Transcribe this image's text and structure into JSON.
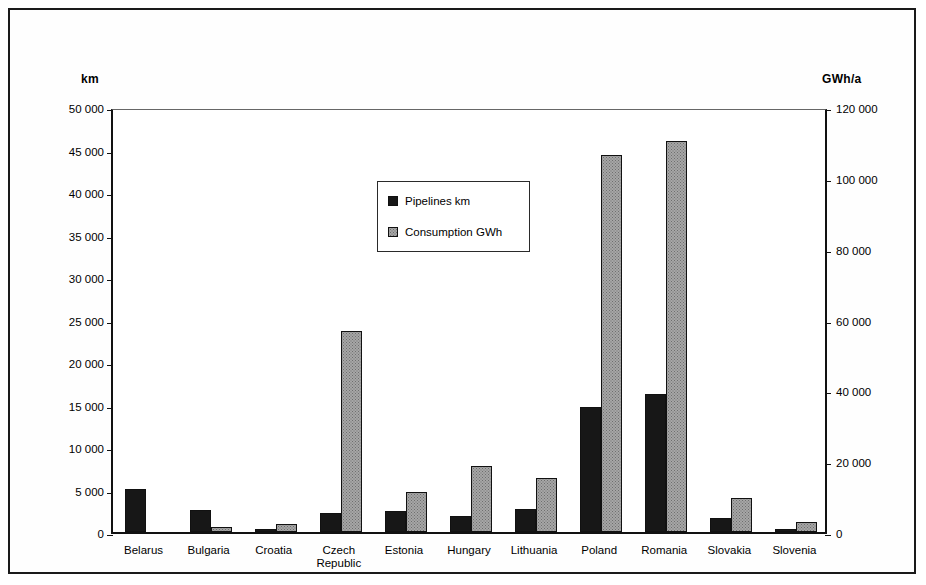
{
  "chart_data": {
    "type": "bar",
    "title": "",
    "xlabel": "",
    "categories": [
      "Belarus",
      "Bulgaria",
      "Croatia",
      "Czech\nRepublic",
      "Estonia",
      "Hungary",
      "Lithuania",
      "Poland",
      "Romania",
      "Slovakia",
      "Slovenia"
    ],
    "series": [
      {
        "name": "Pipelines km",
        "axis": "left",
        "unit": "km",
        "color": "#171717",
        "values": [
          5100,
          2600,
          350,
          2250,
          2450,
          1900,
          2700,
          14700,
          16200,
          1650,
          350
        ]
      },
      {
        "name": "Consumption GWh",
        "axis": "right",
        "unit": "GWh/a",
        "color": "#a6a6a6",
        "values": [
          0,
          1400,
          2300,
          56800,
          11300,
          18600,
          15200,
          106400,
          110400,
          9600,
          2800
        ]
      }
    ],
    "left_axis": {
      "label": "km",
      "min": 0,
      "max": 50000,
      "step": 5000,
      "ticks": [
        0,
        5000,
        10000,
        15000,
        20000,
        25000,
        30000,
        35000,
        40000,
        45000,
        50000
      ],
      "tick_labels": [
        "0",
        "5 000",
        "10 000",
        "15 000",
        "20 000",
        "25 000",
        "30 000",
        "35 000",
        "40 000",
        "45 000",
        "50 000"
      ]
    },
    "right_axis": {
      "label": "GWh/a",
      "min": 0,
      "max": 120000,
      "step": 20000,
      "ticks": [
        0,
        20000,
        40000,
        60000,
        80000,
        100000,
        120000
      ],
      "tick_labels": [
        "0",
        "20 000",
        "40 000",
        "60 000",
        "80 000",
        "100 000",
        "120 000"
      ]
    },
    "grid": false,
    "legend_position": "inside-upper-center",
    "legend": [
      "Pipelines km",
      "Consumption GWh"
    ]
  }
}
